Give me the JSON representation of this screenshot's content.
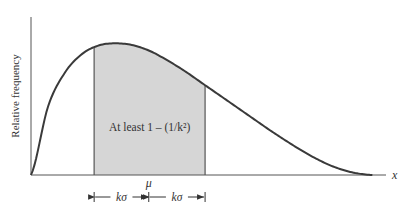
{
  "chart_data": {
    "type": "area",
    "title": "",
    "xlabel": "x",
    "ylabel": "Relative frequency",
    "grid": false,
    "curve": {
      "description": "right-skewed unimodal density",
      "x": [
        0,
        0.5,
        1,
        1.5,
        2,
        2.5,
        3,
        3.5,
        4,
        4.5,
        5,
        5.5,
        6,
        6.5,
        7,
        7.5,
        8,
        8.5,
        9,
        9.5,
        10
      ],
      "y": [
        0.0,
        0.52,
        0.78,
        0.92,
        0.985,
        1.0,
        0.985,
        0.94,
        0.87,
        0.79,
        0.7,
        0.61,
        0.52,
        0.43,
        0.34,
        0.255,
        0.175,
        0.105,
        0.05,
        0.015,
        0.0
      ],
      "xlim": [
        0,
        10.4
      ],
      "ylim": [
        0,
        1.2
      ]
    },
    "shaded_region": {
      "from": "mu - k*sigma",
      "to": "mu + k*sigma",
      "x_from": 1.85,
      "x_to": 5.1,
      "label": "At least 1 – (1/k²)",
      "fill": "#d6d6d6"
    },
    "mu": {
      "label": "μ",
      "x": 3.45
    },
    "interval_labels": {
      "left": "kσ",
      "right": "kσ"
    },
    "line_color": "#3a3a3a"
  }
}
